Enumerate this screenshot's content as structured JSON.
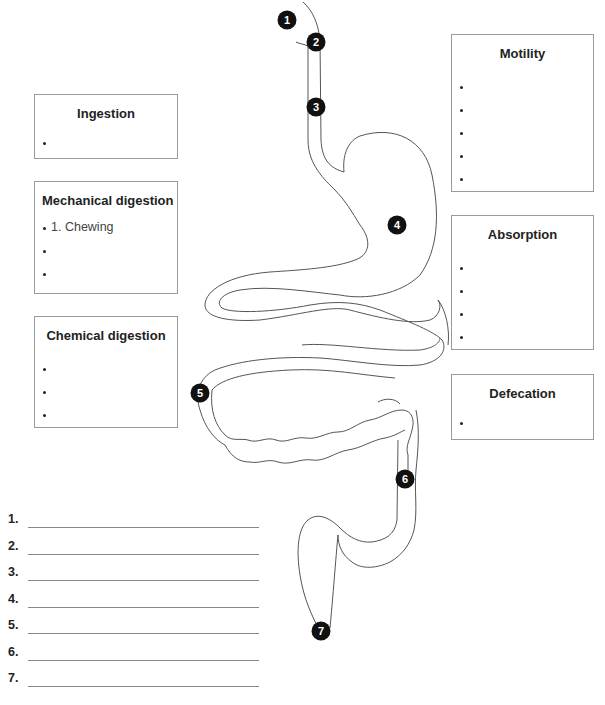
{
  "boxes": {
    "ingestion": {
      "title": "Ingestion",
      "items": [
        ""
      ]
    },
    "mechanical": {
      "title": "Mechanical digestion",
      "items": [
        "1. Chewing",
        "",
        ""
      ]
    },
    "chemical": {
      "title": "Chemical digestion",
      "items": [
        "",
        "",
        ""
      ]
    },
    "motility": {
      "title": "Motility",
      "items": [
        "",
        "",
        "",
        "",
        ""
      ]
    },
    "absorption": {
      "title": "Absorption",
      "items": [
        "",
        "",
        "",
        ""
      ]
    },
    "defecation": {
      "title": "Defecation",
      "items": [
        ""
      ]
    }
  },
  "markers": [
    "1",
    "2",
    "3",
    "4",
    "5",
    "6",
    "7"
  ],
  "answer_blanks": [
    {
      "number": "1.",
      "value": ""
    },
    {
      "number": "2.",
      "value": ""
    },
    {
      "number": "3.",
      "value": ""
    },
    {
      "number": "4.",
      "value": ""
    },
    {
      "number": "5.",
      "value": ""
    },
    {
      "number": "6.",
      "value": ""
    },
    {
      "number": "7.",
      "value": ""
    }
  ],
  "colors": {
    "outline": "#555555",
    "marker": "#111111",
    "box_border": "#9a9a9a"
  }
}
